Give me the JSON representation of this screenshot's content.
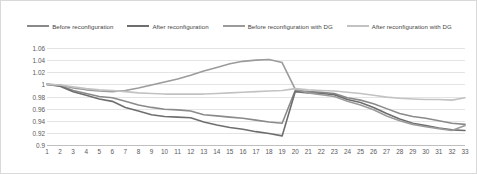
{
  "chart_data": {
    "type": "line",
    "title": "",
    "xlabel": "",
    "ylabel": "",
    "xlim": [
      1,
      33
    ],
    "ylim": [
      0.9,
      1.06
    ],
    "ytick_step": 0.02,
    "grid": true,
    "legend_position": "top-center",
    "categories": [
      1,
      2,
      3,
      4,
      5,
      6,
      7,
      8,
      9,
      10,
      11,
      12,
      13,
      14,
      15,
      16,
      17,
      18,
      19,
      20,
      21,
      22,
      23,
      24,
      25,
      26,
      27,
      28,
      29,
      30,
      31,
      32,
      33
    ],
    "yticks": [
      "1.06",
      "1.04",
      "1.02",
      "1",
      "0.98",
      "0.96",
      "0.94",
      "0.92",
      "0.9"
    ],
    "xticks": [
      "1",
      "2",
      "3",
      "4",
      "5",
      "6",
      "7",
      "8",
      "9",
      "10",
      "11",
      "12",
      "13",
      "14",
      "15",
      "16",
      "17",
      "18",
      "19",
      "20",
      "21",
      "22",
      "23",
      "24",
      "25",
      "26",
      "27",
      "28",
      "29",
      "30",
      "31",
      "32",
      "33"
    ],
    "series": [
      {
        "name": "Before reconfiguration",
        "color": "#8a8a8a",
        "width": 1.6,
        "values": [
          1.0,
          0.998,
          0.99,
          0.985,
          0.98,
          0.978,
          0.972,
          0.966,
          0.962,
          0.959,
          0.958,
          0.956,
          0.95,
          0.948,
          0.946,
          0.944,
          0.941,
          0.938,
          0.936,
          0.99,
          0.988,
          0.987,
          0.985,
          0.978,
          0.974,
          0.968,
          0.96,
          0.952,
          0.947,
          0.944,
          0.94,
          0.936,
          0.934
        ]
      },
      {
        "name": "After reconfiguration",
        "color": "#6e6e6e",
        "width": 1.6,
        "values": [
          1.0,
          0.997,
          0.988,
          0.982,
          0.976,
          0.972,
          0.962,
          0.956,
          0.95,
          0.947,
          0.946,
          0.945,
          0.938,
          0.933,
          0.929,
          0.926,
          0.922,
          0.919,
          0.915,
          0.988,
          0.986,
          0.985,
          0.983,
          0.975,
          0.97,
          0.962,
          0.952,
          0.943,
          0.936,
          0.932,
          0.928,
          0.925,
          0.924
        ]
      },
      {
        "name": "Before reconfiguration with DG",
        "color": "#9b9b9b",
        "width": 1.6,
        "values": [
          1.0,
          0.999,
          0.994,
          0.991,
          0.989,
          0.988,
          0.99,
          0.994,
          0.999,
          1.004,
          1.009,
          1.015,
          1.022,
          1.028,
          1.034,
          1.038,
          1.04,
          1.041,
          1.036,
          0.992,
          0.986,
          0.983,
          0.98,
          0.972,
          0.966,
          0.958,
          0.948,
          0.94,
          0.934,
          0.93,
          0.927,
          0.924,
          0.932
        ]
      },
      {
        "name": "After reconfiguration with DG",
        "color": "#c2c2c2",
        "width": 1.6,
        "values": [
          1.0,
          0.999,
          0.996,
          0.993,
          0.991,
          0.99,
          0.988,
          0.986,
          0.985,
          0.984,
          0.984,
          0.984,
          0.984,
          0.985,
          0.986,
          0.987,
          0.988,
          0.989,
          0.99,
          0.993,
          0.991,
          0.99,
          0.989,
          0.987,
          0.985,
          0.982,
          0.979,
          0.977,
          0.976,
          0.975,
          0.975,
          0.974,
          0.978
        ]
      }
    ]
  },
  "legend": {
    "items": [
      {
        "label": "Before reconfiguration",
        "color": "#8a8a8a"
      },
      {
        "label": "After reconfiguration",
        "color": "#6e6e6e"
      },
      {
        "label": "Before reconfiguration with DG",
        "color": "#9b9b9b"
      },
      {
        "label": "After reconfiguration with DG",
        "color": "#c2c2c2"
      }
    ]
  }
}
